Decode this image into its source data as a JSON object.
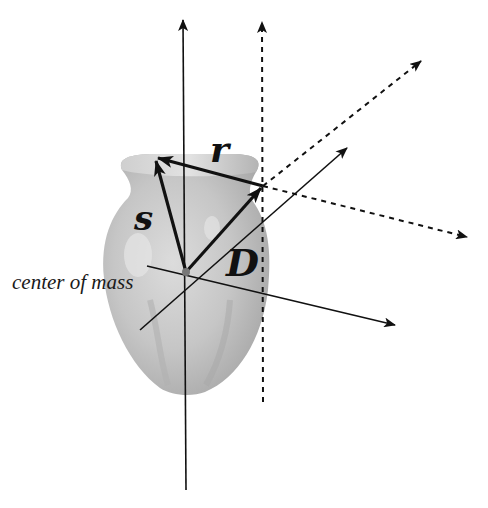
{
  "diagram": {
    "labels": {
      "center_of_mass": "center of mass",
      "vector_r": "r",
      "vector_s": "s",
      "vector_d": "D"
    },
    "colors": {
      "background": "#ffffff",
      "lines": "#111111",
      "vase_light": "#d4d4d4",
      "vase_mid": "#b8b8b8",
      "vase_dark": "#9a9a9a"
    },
    "points": {
      "center_of_mass": [
        186,
        272
      ],
      "translated_origin": [
        263,
        186
      ],
      "s_tip": [
        155,
        158
      ]
    },
    "solid_axes": [
      {
        "name": "vertical-axis",
        "from": [
          186,
          490
        ],
        "to": [
          183,
          18
        ]
      },
      {
        "name": "horizontal-axis",
        "from": [
          147,
          266
        ],
        "to": [
          395,
          325
        ]
      },
      {
        "name": "diagonal-axis",
        "from": [
          140,
          330
        ],
        "to": [
          347,
          147
        ]
      }
    ],
    "dashed_axes": [
      {
        "name": "dashed-vertical-axis",
        "from": [
          263,
          402
        ],
        "to": [
          262,
          18
        ]
      },
      {
        "name": "dashed-diagonal-axis",
        "from": [
          263,
          186
        ],
        "to": [
          422,
          60
        ]
      },
      {
        "name": "dashed-horizontal-axis",
        "from": [
          263,
          186
        ],
        "to": [
          468,
          237
        ]
      }
    ],
    "vectors": [
      {
        "name": "s",
        "from": [
          186,
          272
        ],
        "to": [
          155,
          158
        ]
      },
      {
        "name": "r",
        "from": [
          263,
          186
        ],
        "to": [
          155,
          158
        ]
      },
      {
        "name": "D",
        "from": [
          186,
          272
        ],
        "to": [
          263,
          186
        ]
      }
    ]
  }
}
